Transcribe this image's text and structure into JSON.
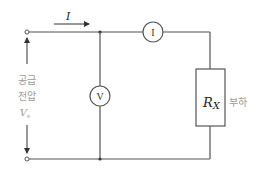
{
  "diagram": {
    "type": "circuit",
    "current_label": "I",
    "ammeter_label": "I",
    "voltmeter_label": "V",
    "resistor_label_main": "R",
    "resistor_label_sub": "X",
    "load_label": "부하",
    "supply_label_line1": "공급",
    "supply_label_line2": "전압",
    "supply_voltage_main": "V",
    "supply_voltage_sub": "s",
    "colors": {
      "wire": "#555555",
      "label_gray": "#9a9a9a",
      "text": "#222222"
    }
  }
}
